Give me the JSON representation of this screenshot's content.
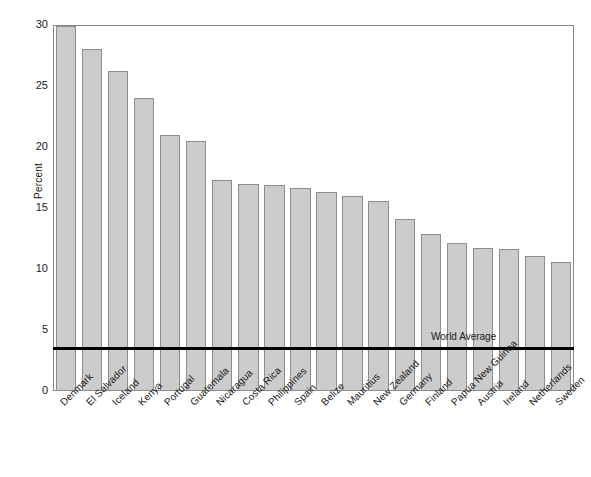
{
  "chart_data": {
    "type": "bar",
    "title": "",
    "xlabel": "",
    "ylabel": "Percent",
    "ylim": [
      0,
      30
    ],
    "yticks": [
      0,
      5,
      10,
      15,
      20,
      25,
      30
    ],
    "grid": false,
    "legend_position": "none",
    "categories": [
      "Denmark",
      "El Salvador",
      "Iceland",
      "Kenya",
      "Portugal",
      "Guatemala",
      "Nicaragua",
      "Costa Rica",
      "Philippines",
      "Spain",
      "Belize",
      "Mauritius",
      "New Zealand",
      "Germany",
      "Finland",
      "Papua New Guinea",
      "Austria",
      "Ireland",
      "Netherlands",
      "Sweden"
    ],
    "values": [
      29.9,
      28.0,
      26.2,
      24.0,
      21.0,
      20.5,
      17.3,
      17.0,
      16.9,
      16.6,
      16.3,
      16.0,
      15.6,
      14.1,
      12.9,
      12.1,
      11.7,
      11.6,
      11.1,
      10.6
    ],
    "annotations": [
      {
        "label": "World Average",
        "type": "horizontal-reference-line",
        "value": 3.5
      }
    ],
    "bar_color": "#cccccc",
    "bar_edge_color": "#8d8d8d",
    "reference_line_color": "#000000"
  },
  "axis": {
    "y_title": "Percent",
    "y_tick_labels": [
      "30",
      "25",
      "20",
      "15",
      "10",
      "5",
      "0"
    ]
  },
  "annotation": {
    "world_average_label": "World Average"
  }
}
